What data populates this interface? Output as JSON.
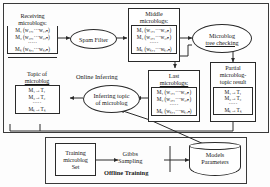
{
  "diagram": {
    "sections": {
      "online": "Online Inferring",
      "offline": "Offline Training"
    },
    "nodes": {
      "receiving": {
        "caption_line1": "Receiving",
        "caption_line2": "microblogs:",
        "rows": [
          "M₁ (w₁,₁···w₁,ₙ)",
          "M₂ (w₂,₁···w₂,ₙ)",
          "·····",
          "Mₖ (wₖ,₁···wₖ,ₙ)"
        ]
      },
      "spam_filter": {
        "label": "Spam Filter"
      },
      "middle": {
        "caption_line1": "Middle",
        "caption_line2": "microblogs:",
        "rows": [
          "M₁ (w₁,₁···w₁,ₙ)",
          "M₂ (w₂,₁···w₂,ₙ)",
          "·····",
          "Mₖ (wₖ,₁···wₖ,ₙ)"
        ]
      },
      "tree_checking": {
        "label_line1": "Microblog",
        "label_line2": "tree checking"
      },
      "partial_result": {
        "caption_line1": "Partial",
        "caption_line2": "microblog-",
        "caption_line3": "topic result",
        "rows": [
          "M₁→T₁",
          "M₂→T₂",
          "·····",
          "Mₖ→Tₖ"
        ]
      },
      "last": {
        "caption_line1": "Last",
        "caption_line2": "microblogs:",
        "rows": [
          "M₁ (w₁,₁···w₁,ₙ)",
          "M₂ (w₂,₁···w₂,ₙ)",
          "·····",
          "Mₖ (wₖ,₁···wₖ,ₙ)"
        ]
      },
      "inferring": {
        "label_line1": "Inferring topic",
        "label_line2": "of microblog"
      },
      "topic": {
        "caption_line1": "Topic of",
        "caption_line2": "microblog",
        "rows": [
          "M₁→T₁",
          "M₂→T₂",
          "·····",
          "Mₖ→Tₖ"
        ]
      },
      "training_set": {
        "line1": "Training",
        "line2": "microblog",
        "line3": "Set"
      },
      "gibbs": {
        "line1": "Gibbs",
        "line2": "Sampling"
      },
      "models": {
        "line1": "Models",
        "line2": "Parameters"
      }
    }
  },
  "colors": {
    "stroke": "#2a2a2a",
    "background": "#fdfdfd",
    "text": "#1a1a1a"
  }
}
